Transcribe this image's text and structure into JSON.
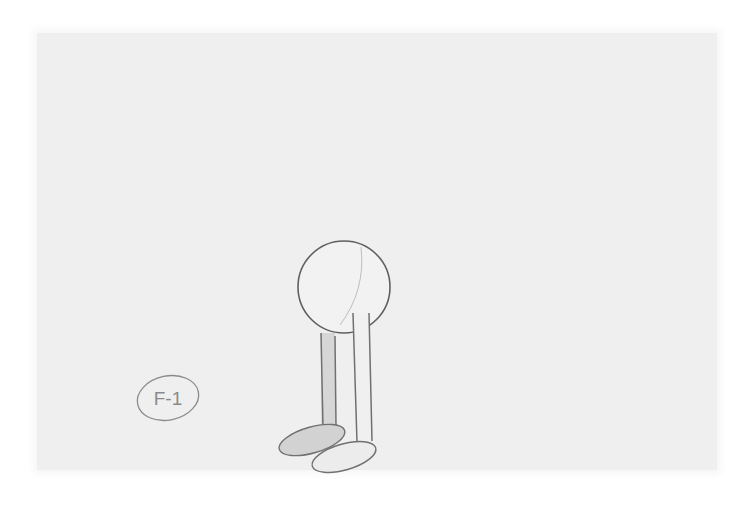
{
  "image": {
    "type": "pencil-sketch",
    "subject": "character-with-circle-body-and-two-legs",
    "frame_label": "F-1",
    "colors": {
      "paper": "#efefef",
      "pencil_line": "#6e6e6e",
      "shading": "#d2d2d2",
      "background": "#ffffff"
    }
  }
}
